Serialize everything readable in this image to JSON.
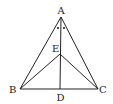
{
  "figure": {
    "type": "geometry",
    "points": {
      "A": {
        "label": "A",
        "x": 61,
        "y": 17
      },
      "B": {
        "label": "B",
        "x": 20,
        "y": 89
      },
      "C": {
        "label": "C",
        "x": 98,
        "y": 89
      },
      "D": {
        "label": "D",
        "x": 60,
        "y": 89
      },
      "E": {
        "label": "E",
        "x": 60,
        "y": 54
      }
    },
    "segments": [
      "AB",
      "AC",
      "BC",
      "AD",
      "EB",
      "EC"
    ],
    "angle_marks": "Two equal-angle dots at vertex A on either side of AD",
    "colors": {
      "stroke": "#222222",
      "background": "#ffffff"
    }
  }
}
